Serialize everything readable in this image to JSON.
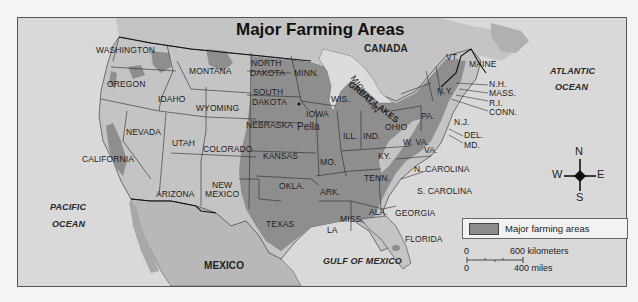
{
  "map": {
    "title": "Major Farming Areas",
    "countries": {
      "canada": "CANADA",
      "mexico": "MEXICO"
    },
    "water": {
      "pacific_line1": "PACIFIC",
      "pacific_line2": "OCEAN",
      "atlantic_line1": "ATLANTIC",
      "atlantic_line2": "OCEAN",
      "gulf": "GULF OF MEXICO",
      "great_lakes": "GREAT LAKES"
    },
    "states": {
      "washington": "WASHINGTON",
      "oregon": "OREGON",
      "california": "CALIFORNIA",
      "idaho": "IDAHO",
      "nevada": "NEVADA",
      "montana": "MONTANA",
      "wyoming": "WYOMING",
      "utah": "UTAH",
      "colorado": "COLORADO",
      "arizona": "ARIZONA",
      "new_mexico_1": "NEW",
      "new_mexico_2": "MEXICO",
      "north_dakota_1": "NORTH",
      "north_dakota_2": "DAKOTA",
      "south_dakota_1": "SOUTH",
      "south_dakota_2": "DAKOTA",
      "nebraska": "NEBRASKA",
      "kansas": "KANSAS",
      "oklahoma": "OKLA.",
      "texas": "TEXAS",
      "minnesota": "MINN.",
      "iowa": "IOWA",
      "missouri": "MO.",
      "arkansas": "ARK.",
      "louisiana": "LA",
      "wisconsin": "WIS.",
      "illinois": "ILL.",
      "michigan": "MICHIGAN",
      "indiana": "IND.",
      "ohio": "OHIO",
      "kentucky": "KY.",
      "tennessee": "TENN.",
      "mississippi": "MISS",
      "alabama": "ALA.",
      "georgia": "GEORGIA",
      "florida": "FLORIDA",
      "south_carolina": "S. CAROLINA",
      "north_carolina": "N. CAROLINA",
      "virginia": "VA.",
      "west_virginia": "W. VA.",
      "pennsylvania": "PA.",
      "new_york": "N.Y.",
      "new_jersey": "N.J.",
      "delaware": "DEL.",
      "maryland": "MD.",
      "vermont": "VT.",
      "maine": "MAINE",
      "new_hampshire": "N.H.",
      "massachusetts": "MASS.",
      "rhode_island": "R.I.",
      "connecticut": "CONN."
    },
    "cities": {
      "pella": "Pella"
    },
    "legend": {
      "label": "Major farming areas",
      "swatch_color": "#8c8c8c"
    },
    "scale": {
      "km_zero": "0",
      "km_label": "600 kilometers",
      "mi_zero": "0",
      "mi_label": "400 miles"
    },
    "compass": {
      "n": "N",
      "s": "S",
      "e": "E",
      "w": "W"
    },
    "colors": {
      "water": "#d9d9d9",
      "land": "#c4c4c4",
      "farmland": "#8e8e8e",
      "border": "#2a2a2a"
    }
  }
}
